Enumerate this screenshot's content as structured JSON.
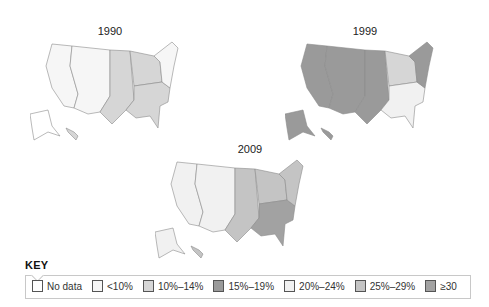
{
  "maps": [
    {
      "year": "1990",
      "id": "map-1990"
    },
    {
      "year": "1999",
      "id": "map-1999"
    },
    {
      "year": "2009",
      "id": "map-2009"
    }
  ],
  "key": {
    "title": "KEY",
    "items": [
      {
        "label": "No data",
        "color": "#ffffff"
      },
      {
        "label": "<10%",
        "color": "#f6f6f6"
      },
      {
        "label": "10%–14%",
        "color": "#d6d6d6"
      },
      {
        "label": "15%–19%",
        "color": "#9a9a9a"
      },
      {
        "label": "20%–24%",
        "color": "#f1f1f1"
      },
      {
        "label": "25%–29%",
        "color": "#c4c4c4"
      },
      {
        "label": "≥30",
        "color": "#a2a2a2"
      }
    ]
  },
  "regions": {
    "1990": {
      "west": "#f6f6f6",
      "pacific": "#f6f6f6",
      "plains": "#d6d6d6",
      "midwest": "#d6d6d6",
      "south": "#d6d6d6",
      "northeast": "#f6f6f6",
      "alaska": "#ffffff",
      "hawaii": "#d6d6d6"
    },
    "1999": {
      "west": "#9a9a9a",
      "pacific": "#9a9a9a",
      "plains": "#9a9a9a",
      "midwest": "#d6d6d6",
      "south": "#f1f1f1",
      "northeast": "#9a9a9a",
      "alaska": "#9a9a9a",
      "hawaii": "#9a9a9a"
    },
    "2009": {
      "west": "#f1f1f1",
      "pacific": "#f1f1f1",
      "plains": "#c4c4c4",
      "midwest": "#c4c4c4",
      "south": "#a2a2a2",
      "northeast": "#c4c4c4",
      "alaska": "#f1f1f1",
      "hawaii": "#c4c4c4"
    }
  }
}
